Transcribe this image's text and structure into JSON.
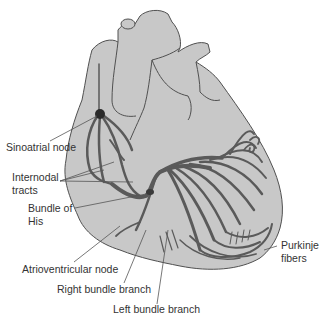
{
  "diagram": {
    "colors": {
      "heart_fill": "#c8c8c8",
      "outline": "#505050",
      "conduction": "#5a5a5a",
      "node": "#2a2a2a",
      "leader_line": "#555555",
      "text": "#333333",
      "background": "#ffffff"
    },
    "labels": {
      "sa_node": "Sinoatrial node",
      "internodal_1": "Internodal",
      "internodal_2": "tracts",
      "bundle_his_1": "Bundle of",
      "bundle_his_2": "His",
      "av_node": "Atrioventricular node",
      "right_bundle": "Right bundle branch",
      "left_bundle": "Left bundle branch",
      "purkinje_1": "Purkinje",
      "purkinje_2": "fibers"
    }
  }
}
